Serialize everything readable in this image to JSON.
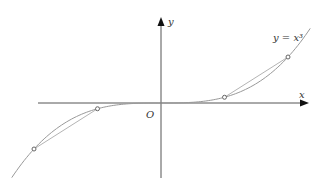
{
  "chart_data": {
    "type": "line",
    "title": "",
    "xlabel": "x",
    "ylabel": "y",
    "origin_label": "O",
    "curve_label": "y = x³",
    "function": "x^3",
    "xlim": [
      -2.35,
      2.35
    ],
    "ylim": [
      -13.0,
      14.5
    ],
    "series": [
      {
        "name": "y = x^3",
        "kind": "curve",
        "x_range": [
          -2.35,
          2.35
        ]
      },
      {
        "name": "left-chord",
        "kind": "segment",
        "points": [
          [
            -2,
            -8
          ],
          [
            -1,
            -1
          ]
        ]
      },
      {
        "name": "right-chord",
        "kind": "segment",
        "points": [
          [
            1,
            1
          ],
          [
            2,
            8
          ]
        ]
      }
    ],
    "marked_points": [
      [
        -2,
        -8
      ],
      [
        -1,
        -1
      ],
      [
        1,
        1
      ],
      [
        2,
        8
      ]
    ],
    "grid": false,
    "colors": {
      "axis": "#555555",
      "curve": "#999999",
      "point": "#666666"
    }
  }
}
